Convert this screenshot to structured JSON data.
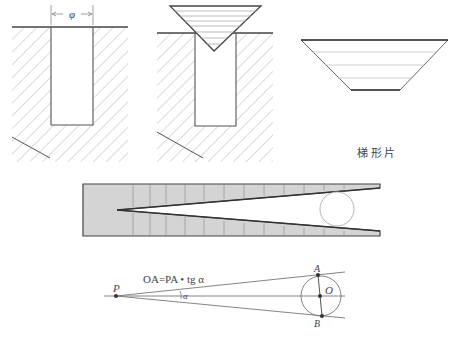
{
  "figures": {
    "slot": {
      "dimension_label": "φ"
    },
    "triangle_in_slot": {},
    "trapezoid": {
      "caption": "梯 形 片"
    },
    "wedge_gauge": {},
    "geometry": {
      "formula": "OA=PA • tg α",
      "angle_label": "α",
      "point_p": "P",
      "point_a": "A",
      "point_b": "B",
      "point_o": "O"
    }
  },
  "colors": {
    "ink": "#555555",
    "hatch": "#b8b8b8",
    "gauge_fill": "#d4d4d4"
  }
}
